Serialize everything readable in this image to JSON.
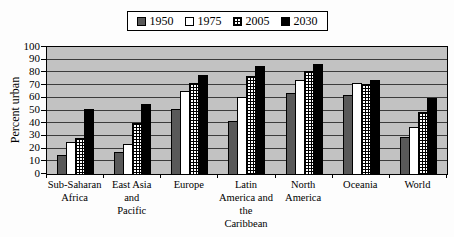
{
  "chart_data": {
    "type": "bar",
    "title": "",
    "ylabel": "Percent urban",
    "xlabel": "",
    "ylim": [
      0,
      100
    ],
    "yticks": [
      0,
      10,
      20,
      30,
      40,
      50,
      60,
      70,
      80,
      90,
      100
    ],
    "grid": true,
    "legend_position": "top",
    "plot_bg": "#c2c2c2",
    "gridline_color": "#3c3c3c",
    "categories": [
      "Sub-Saharan Africa",
      "East Asia and Pacific",
      "Europe",
      "Latin America and the Caribbean",
      "North America",
      "Oceania",
      "World"
    ],
    "category_label_lines": [
      [
        "Sub-Saharan",
        "Africa"
      ],
      [
        "East Asia",
        "and",
        "Pacific"
      ],
      [
        "Europe"
      ],
      [
        "Latin",
        "America and",
        "the",
        "Caribbean"
      ],
      [
        "North",
        "America"
      ],
      [
        "Oceania"
      ],
      [
        "World"
      ]
    ],
    "series": [
      {
        "name": "1950",
        "pattern": "solid",
        "color": "#595959",
        "values": [
          15,
          17,
          51,
          42,
          64,
          62,
          29
        ]
      },
      {
        "name": "1975",
        "pattern": "solid",
        "color": "#ffffff",
        "values": [
          25,
          24,
          65,
          61,
          74,
          72,
          37
        ]
      },
      {
        "name": "2005",
        "pattern": "grid",
        "color": "#ffffff",
        "values": [
          28,
          40,
          72,
          77,
          81,
          71,
          49
        ]
      },
      {
        "name": "2030",
        "pattern": "solid",
        "color": "#000000",
        "values": [
          51,
          55,
          78,
          85,
          87,
          74,
          60
        ]
      }
    ]
  }
}
